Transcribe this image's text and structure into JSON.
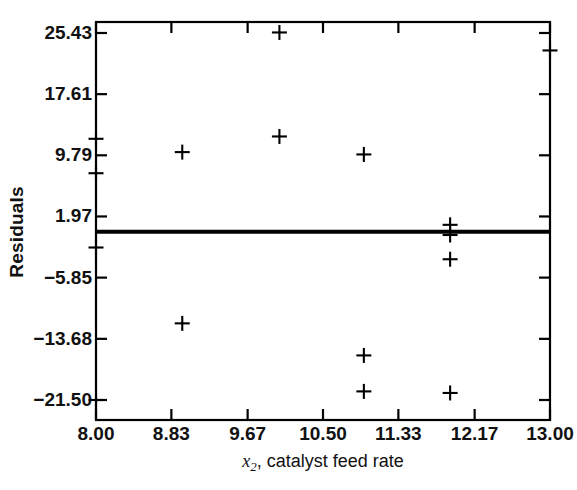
{
  "chart_data": {
    "type": "scatter",
    "title": "",
    "subtitle": "",
    "xlabel": "x2, catalyst feed rate",
    "xlabel_parts": {
      "variable": "x",
      "subscript": "2",
      "rest": ", catalyst feed rate"
    },
    "ylabel": "Residuals",
    "xlim": [
      8.0,
      13.0
    ],
    "ylim": [
      -21.5,
      25.43
    ],
    "xticks": [
      8.0,
      8.83,
      9.67,
      10.5,
      11.33,
      12.17,
      13.0
    ],
    "xticklabels": [
      "8.00",
      "8.83",
      "9.67",
      "10.50",
      "11.33",
      "12.17",
      "13.00"
    ],
    "yticks": [
      25.43,
      17.61,
      9.79,
      1.97,
      -5.85,
      -13.68,
      -21.5
    ],
    "yticklabels": [
      "25.43",
      "17.61",
      "9.79",
      "1.97",
      "−5.85",
      "−13.68",
      "−21.50"
    ],
    "grid": false,
    "legend": null,
    "marker": "plus",
    "marker_color": "#000000",
    "frame_color": "#000000",
    "reference_line": {
      "orientation": "horizontal",
      "value": 0.0,
      "color": "#000000",
      "width_px": 4,
      "label": "zero-residual-line"
    },
    "series": [
      {
        "name": "residuals",
        "x": [
          8.0,
          8.0,
          8.0,
          8.0,
          8.95,
          8.95,
          10.02,
          10.02,
          10.95,
          10.95,
          10.95,
          11.9,
          11.9,
          11.9,
          11.9,
          13.0
        ],
        "y": [
          11.9,
          7.5,
          -2.0,
          -21.5,
          10.2,
          -11.7,
          25.5,
          12.2,
          9.9,
          -15.8,
          -20.4,
          0.9,
          -0.4,
          -3.5,
          -20.6,
          23.2
        ]
      }
    ]
  }
}
